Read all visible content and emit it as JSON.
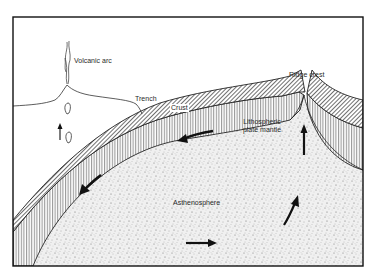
{
  "diagram": {
    "type": "cross-section",
    "labels": {
      "volcanic_arc": "Volcanic arc",
      "trench": "Trench",
      "crust": "Crust",
      "ridge_crest": "Ridge crest",
      "lithospheric_plate_mantle_line1": "Lithospheric",
      "lithospheric_plate_mantle_line2": "plate mantle",
      "asthenosphere": "Asthenosphere"
    },
    "layers": [
      {
        "name": "Crust",
        "pattern": "diagonal-hatch"
      },
      {
        "name": "Lithospheric plate mantle",
        "pattern": "vertical-lines"
      },
      {
        "name": "Asthenosphere",
        "pattern": "stipple"
      }
    ],
    "arrows": [
      {
        "location": "lithosphere near crest",
        "direction": "left"
      },
      {
        "location": "subducting slab",
        "direction": "down-left"
      },
      {
        "location": "asthenosphere bottom",
        "direction": "right"
      },
      {
        "location": "asthenosphere rising",
        "direction": "up-right"
      },
      {
        "location": "under ridge crest",
        "direction": "up"
      },
      {
        "location": "magma above slab",
        "direction": "up"
      }
    ],
    "colors": {
      "ink": "#1a1a1a",
      "paper": "#ffffff",
      "stipple": "#d9d9d9"
    }
  }
}
